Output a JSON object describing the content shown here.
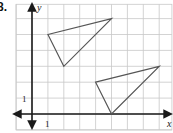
{
  "problem": {
    "number": "8."
  },
  "axes": {
    "x_label": "x",
    "y_label": "y",
    "x_tick_label": "1",
    "y_tick_label": "1"
  },
  "grid": {
    "origin_px": [
      32,
      114
    ],
    "unit_px": 15.9,
    "x_range": [
      -1,
      8.8
    ],
    "y_range": [
      -1,
      6.9
    ]
  },
  "shapes": {
    "triangle_a": {
      "vertices": [
        [
          1,
          5
        ],
        [
          5,
          6
        ],
        [
          2,
          3
        ]
      ]
    },
    "triangle_b": {
      "vertices": [
        [
          4,
          2
        ],
        [
          8,
          3
        ],
        [
          5,
          0
        ]
      ]
    }
  },
  "colors": {
    "grid": "#c8c8c8",
    "axis": "#1a1a1a",
    "triangle": "#555555"
  }
}
